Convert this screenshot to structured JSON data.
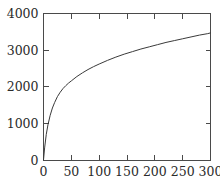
{
  "chart_data": {
    "type": "line",
    "title": "",
    "subtitle": "",
    "xlabel": "",
    "ylabel": "",
    "xlim": [
      0,
      300
    ],
    "ylim": [
      0,
      4000
    ],
    "grid": false,
    "legend": null,
    "legend_position": "none",
    "x_ticks": [
      0,
      50,
      100,
      150,
      200,
      250,
      300
    ],
    "x_tick_labels": [
      "0",
      "50",
      "100",
      "150",
      "200",
      "250",
      "300"
    ],
    "y_ticks": [
      0,
      1000,
      2000,
      3000,
      4000
    ],
    "y_tick_labels": [
      "0",
      "1000",
      "2000",
      "3000",
      "4000"
    ],
    "series": [
      {
        "name": "curve",
        "color": "#3a3a3a",
        "x": [
          0,
          2,
          5,
          8,
          12,
          16,
          20,
          25,
          30,
          35,
          40,
          45,
          50,
          60,
          70,
          80,
          90,
          100,
          115,
          130,
          145,
          160,
          175,
          190,
          205,
          220,
          235,
          250,
          265,
          280,
          295,
          300
        ],
        "y": [
          0,
          330,
          700,
          960,
          1220,
          1420,
          1570,
          1730,
          1850,
          1950,
          2030,
          2100,
          2160,
          2280,
          2380,
          2470,
          2550,
          2620,
          2720,
          2810,
          2890,
          2960,
          3030,
          3090,
          3150,
          3210,
          3260,
          3310,
          3360,
          3410,
          3450,
          3470
        ]
      }
    ]
  },
  "axes": {
    "frame_color": "#4a4a4a",
    "tick_color": "#4a4a4a",
    "label_color": "#2b2b2b"
  }
}
